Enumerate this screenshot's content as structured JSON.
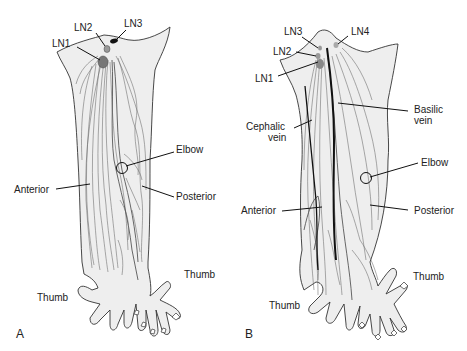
{
  "figure": {
    "panels": [
      {
        "id": "A",
        "panel_label": "A",
        "labels": {
          "ln1": "LN1",
          "ln2": "LN2",
          "ln3": "LN3",
          "elbow": "Elbow",
          "anterior": "Anterior",
          "posterior": "Posterior",
          "thumb_left": "Thumb",
          "thumb_right": "Thumb"
        }
      },
      {
        "id": "B",
        "panel_label": "B",
        "labels": {
          "ln1": "LN1",
          "ln2": "LN2",
          "ln3": "LN3",
          "ln4": "LN4",
          "cephalic_line1": "Cephalic",
          "cephalic_line2": "vein",
          "basilic_line1": "Basilic",
          "basilic_line2": "vein",
          "elbow": "Elbow",
          "anterior": "Anterior",
          "posterior": "Posterior",
          "thumb_left": "Thumb",
          "thumb_right": "Thumb"
        }
      }
    ],
    "colors": {
      "background": "#ffffff",
      "limb_fill": "#eeeeee",
      "outline": "#333333",
      "lymph_vessel": "#666666",
      "vein": "#111111",
      "node": "#777777"
    }
  }
}
